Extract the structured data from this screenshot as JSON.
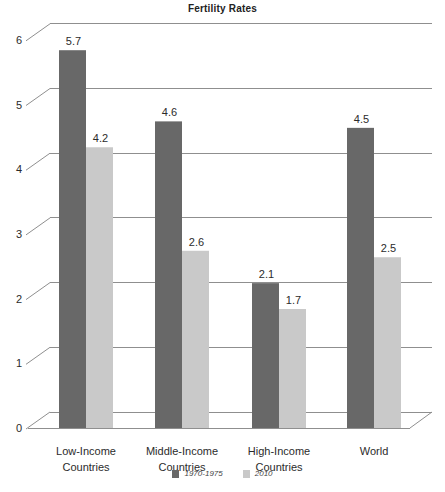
{
  "chart_data": {
    "type": "bar",
    "title": "Fertility Rates",
    "style": "2.5d-oblique-grouped-bars",
    "categories": [
      "Low-Income Countries",
      "Middle-Income Countries",
      "High-Income Countries",
      "World"
    ],
    "series": [
      {
        "name": "1970-1975",
        "color": "#686868",
        "values": [
          5.7,
          4.6,
          2.1,
          4.5
        ]
      },
      {
        "name": "2010",
        "color": "#c9c9c9",
        "values": [
          4.2,
          2.6,
          1.7,
          2.5
        ]
      }
    ],
    "xlabel": "",
    "ylabel": "",
    "ylim": [
      0,
      6
    ],
    "yticks": [
      0,
      1,
      2,
      3,
      4,
      5,
      6
    ],
    "grid": true,
    "data_labels_shown": true,
    "legend_position": "bottom-center"
  },
  "colors": {
    "background": "#ffffff",
    "bar_1970_1975": "#686868",
    "bar_2010": "#c9c9c9",
    "gridline": "#8f8f8f",
    "text": "#2b2b2b"
  }
}
